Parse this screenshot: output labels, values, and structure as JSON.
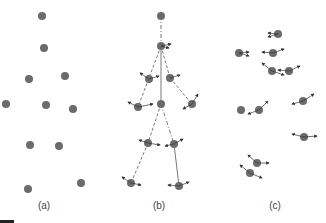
{
  "figure": {
    "width": 326,
    "height": 223,
    "colors": {
      "dot": "#6b6b6b",
      "line": "#555555",
      "arrow": "#333333",
      "text": "#444444"
    },
    "dot_radius": 4
  },
  "panels": [
    {
      "id": "a",
      "label": "(a)",
      "label_pos": [
        44,
        209
      ],
      "points": [
        [
          42,
          16
        ],
        [
          44,
          48
        ],
        [
          29,
          79
        ],
        [
          65,
          76
        ],
        [
          6,
          104
        ],
        [
          46,
          105
        ],
        [
          73,
          109
        ],
        [
          30,
          145
        ],
        [
          59,
          146
        ],
        [
          28,
          189
        ],
        [
          81,
          183
        ]
      ],
      "edges": [],
      "arrows": []
    },
    {
      "id": "b",
      "label": "(b)",
      "label_pos": [
        159,
        209
      ],
      "points": [
        [
          161,
          16
        ],
        [
          161,
          46
        ],
        [
          149,
          79
        ],
        [
          170,
          78
        ],
        [
          138,
          107
        ],
        [
          161,
          104
        ],
        [
          192,
          104
        ],
        [
          148,
          143
        ],
        [
          174,
          144
        ],
        [
          131,
          183
        ],
        [
          179,
          186
        ]
      ],
      "edges": [
        {
          "from": 0,
          "to": 1,
          "style": "dashdot"
        },
        {
          "from": 1,
          "to": 3,
          "style": "dashed"
        },
        {
          "from": 1,
          "to": 4,
          "style": "dashed"
        },
        {
          "from": 1,
          "to": 5,
          "style": "solid"
        },
        {
          "from": 3,
          "to": 6,
          "style": "dashed"
        },
        {
          "from": 5,
          "to": 8,
          "style": "dashdot"
        },
        {
          "from": 5,
          "to": 7,
          "style": "dashed"
        },
        {
          "from": 7,
          "to": 9,
          "style": "dashed"
        },
        {
          "from": 8,
          "to": 10,
          "style": "solid"
        }
      ],
      "arrows": [
        [
          [
            161,
            46
          ],
          [
            171,
            44
          ]
        ],
        [
          [
            161,
            46
          ],
          [
            169,
            48
          ]
        ],
        [
          [
            149,
            79
          ],
          [
            140,
            73
          ]
        ],
        [
          [
            149,
            79
          ],
          [
            159,
            76
          ]
        ],
        [
          [
            170,
            78
          ],
          [
            180,
            75
          ]
        ],
        [
          [
            138,
            107
          ],
          [
            128,
            102
          ]
        ],
        [
          [
            138,
            107
          ],
          [
            153,
            104
          ]
        ],
        [
          [
            192,
            104
          ],
          [
            198,
            94
          ]
        ],
        [
          [
            192,
            104
          ],
          [
            183,
            109
          ]
        ],
        [
          [
            148,
            143
          ],
          [
            139,
            140
          ]
        ],
        [
          [
            148,
            143
          ],
          [
            160,
            145
          ]
        ],
        [
          [
            174,
            144
          ],
          [
            183,
            139
          ]
        ],
        [
          [
            174,
            144
          ],
          [
            165,
            146
          ]
        ],
        [
          [
            131,
            183
          ],
          [
            122,
            177
          ]
        ],
        [
          [
            131,
            183
          ],
          [
            141,
            185
          ]
        ],
        [
          [
            179,
            186
          ],
          [
            168,
            185
          ]
        ],
        [
          [
            179,
            186
          ],
          [
            189,
            182
          ]
        ]
      ]
    },
    {
      "id": "c",
      "label": "(c)",
      "label_pos": [
        275,
        209
      ],
      "points": [
        [
          278,
          34
        ],
        [
          239,
          53
        ],
        [
          273,
          53
        ],
        [
          272,
          71
        ],
        [
          289,
          71
        ],
        [
          241,
          110
        ],
        [
          259,
          110
        ],
        [
          303,
          101
        ],
        [
          304,
          137
        ],
        [
          257,
          163
        ],
        [
          250,
          173
        ]
      ],
      "edges": [],
      "arrows": [
        [
          [
            278,
            34
          ],
          [
            268,
            37
          ]
        ],
        [
          [
            278,
            34
          ],
          [
            268,
            33
          ]
        ],
        [
          [
            239,
            53
          ],
          [
            249,
            52
          ]
        ],
        [
          [
            239,
            53
          ],
          [
            249,
            56
          ]
        ],
        [
          [
            273,
            53
          ],
          [
            262,
            52
          ]
        ],
        [
          [
            273,
            53
          ],
          [
            284,
            49
          ]
        ],
        [
          [
            272,
            71
          ],
          [
            262,
            63
          ]
        ],
        [
          [
            272,
            71
          ],
          [
            284,
            75
          ]
        ],
        [
          [
            289,
            71
          ],
          [
            278,
            70
          ]
        ],
        [
          [
            289,
            71
          ],
          [
            300,
            66
          ]
        ],
        [
          [
            259,
            110
          ],
          [
            248,
            114
          ]
        ],
        [
          [
            259,
            110
          ],
          [
            268,
            101
          ]
        ],
        [
          [
            303,
            101
          ],
          [
            292,
            104
          ]
        ],
        [
          [
            303,
            101
          ],
          [
            314,
            94
          ]
        ],
        [
          [
            304,
            137
          ],
          [
            292,
            134
          ]
        ],
        [
          [
            304,
            137
          ],
          [
            317,
            136
          ]
        ],
        [
          [
            257,
            163
          ],
          [
            248,
            155
          ]
        ],
        [
          [
            257,
            163
          ],
          [
            269,
            163
          ]
        ],
        [
          [
            250,
            173
          ],
          [
            240,
            165
          ]
        ],
        [
          [
            250,
            173
          ],
          [
            262,
            178
          ]
        ]
      ]
    }
  ],
  "corner_bar": {
    "x": 0,
    "y": 220,
    "w": 14,
    "h": 3
  }
}
